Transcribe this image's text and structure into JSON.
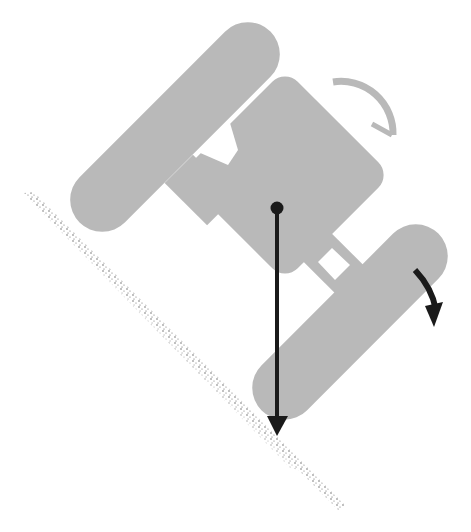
{
  "diagram": {
    "colors": {
      "tractor": "#b9b9b9",
      "arrow": "#1a1a1a",
      "ground": "#555555",
      "background": "#ffffff"
    },
    "elements": {
      "upper_tire": "tire",
      "lower_tire": "tire",
      "body": "tractor-body",
      "steering_wheel": "steering-wheel",
      "center_of_gravity": "center-of-gravity-point",
      "gravity_arrow": "downward-force-arrow",
      "rotation_arrow": "rollover-direction-arrow",
      "slope": "ground-slope"
    }
  }
}
